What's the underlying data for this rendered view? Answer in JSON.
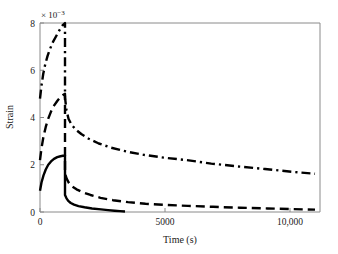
{
  "chart_data": {
    "type": "line",
    "title": "",
    "xlabel": "Time (s)",
    "ylabel": "Strain",
    "y_exponent_label": "× 10",
    "y_exponent_sup": "−3",
    "y_scale_factor": 0.001,
    "xlim": [
      0,
      11200
    ],
    "ylim": [
      0,
      8
    ],
    "xticks": [
      0,
      5000,
      10000
    ],
    "xticklabels": [
      "0",
      "5000",
      "10,000"
    ],
    "yticks": [
      0,
      2,
      4,
      6,
      8
    ],
    "yticklabels": [
      "0",
      "2",
      "4",
      "6",
      "8"
    ],
    "grid": false,
    "legend": null,
    "series": [
      {
        "name": "dash-dot-curve",
        "style": "dashdot",
        "color": "#000000",
        "description": "Loading from 4.8 rising to peak 8.0 at t=1000 s, then creep recovery decaying to 1.62 at t=11000 s",
        "x": [
          0,
          60,
          130,
          210,
          300,
          400,
          520,
          650,
          780,
          900,
          1000,
          1000,
          1060,
          1140,
          1260,
          1420,
          1650,
          1950,
          2350,
          2850,
          3450,
          4150,
          4950,
          5850,
          6850,
          7900,
          9000,
          10100,
          11000
        ],
        "y": [
          4.8,
          5.35,
          5.85,
          6.25,
          6.6,
          6.9,
          7.2,
          7.45,
          7.7,
          7.9,
          8.0,
          4.85,
          4.3,
          3.95,
          3.7,
          3.5,
          3.3,
          3.1,
          2.9,
          2.72,
          2.56,
          2.42,
          2.3,
          2.2,
          2.05,
          1.93,
          1.82,
          1.7,
          1.62
        ]
      },
      {
        "name": "dashed-curve",
        "style": "dashed",
        "color": "#000000",
        "description": "Loading from 2.2 rising to peak 5.0 at t=1000 s, then recovery decaying to 0.10 at t=11000 s",
        "x": [
          0,
          60,
          140,
          230,
          330,
          440,
          560,
          690,
          820,
          920,
          1000,
          1000,
          1070,
          1160,
          1290,
          1460,
          1700,
          2020,
          2420,
          2920,
          3520,
          4220,
          5020,
          5920,
          6920,
          8000,
          9100,
          10150,
          11000
        ],
        "y": [
          2.2,
          2.7,
          3.2,
          3.6,
          3.95,
          4.25,
          4.5,
          4.7,
          4.87,
          4.95,
          5.0,
          1.62,
          1.4,
          1.22,
          1.08,
          0.96,
          0.84,
          0.72,
          0.6,
          0.5,
          0.42,
          0.35,
          0.3,
          0.26,
          0.22,
          0.18,
          0.15,
          0.12,
          0.1
        ]
      },
      {
        "name": "solid-curve",
        "style": "solid",
        "color": "#000000",
        "description": "Loading from 0.9 rising to peak 2.38 at t=1000 s, then recovery decaying to ~0.02 at t=3400 s",
        "x": [
          0,
          60,
          140,
          230,
          330,
          440,
          560,
          690,
          820,
          920,
          1000,
          1000,
          1060,
          1130,
          1230,
          1360,
          1540,
          1780,
          2080,
          2440,
          2720,
          2980,
          3200,
          3400
        ],
        "y": [
          0.9,
          1.25,
          1.55,
          1.8,
          2.0,
          2.14,
          2.25,
          2.32,
          2.36,
          2.38,
          2.38,
          0.72,
          0.58,
          0.47,
          0.38,
          0.31,
          0.25,
          0.2,
          0.15,
          0.11,
          0.08,
          0.055,
          0.035,
          0.02
        ]
      }
    ]
  }
}
